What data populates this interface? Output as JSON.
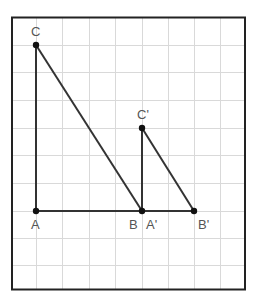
{
  "figure": {
    "grid": {
      "columns": 9,
      "rows": 10,
      "line_color": "#d9d9d9",
      "border_color": "#222222"
    },
    "colors": {
      "segment": "#333333",
      "point": "#111111",
      "label": "#555555"
    },
    "points": [
      {
        "name": "C",
        "label": "C",
        "x": 36,
        "y": 45
      },
      {
        "name": "A",
        "label": "A",
        "x": 36,
        "y": 211
      },
      {
        "name": "B",
        "label": "B",
        "x": 142,
        "y": 211
      },
      {
        "name": "C'",
        "label": "C'",
        "x": 142,
        "y": 128
      },
      {
        "name": "A'",
        "label": "A'",
        "x": 142,
        "y": 211
      },
      {
        "name": "B'",
        "label": "B'",
        "x": 194,
        "y": 211
      }
    ],
    "labels": {
      "C": "C",
      "A": "A",
      "B": "B",
      "A_prime": "A'",
      "B_prime": "B'",
      "C_prime": "C'"
    },
    "segments": [
      [
        "C",
        "A"
      ],
      [
        "A",
        "B"
      ],
      [
        "C",
        "B"
      ],
      [
        "C'",
        "A'"
      ],
      [
        "A'",
        "B'"
      ],
      [
        "C'",
        "B'"
      ]
    ]
  }
}
